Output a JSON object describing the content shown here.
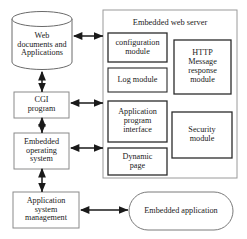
{
  "diagram": {
    "colors": {
      "stroke": "#2b2b2b",
      "panel_stroke": "#6e6e6e",
      "module_stroke": "#2b2b2b",
      "box_stroke": "#8a8a8a",
      "background": "#ffffff",
      "text": "#1a1a1a"
    },
    "left_column": {
      "datastore": {
        "label": "Web\ndocuments and\nApplications",
        "shape": "cylinder"
      },
      "boxes": [
        {
          "label": "CGI\nprogram",
          "shape": "rectangle"
        },
        {
          "label": "Embedded\noperating\nsystem",
          "shape": "rectangle"
        },
        {
          "label": "Application\nsystem\nmanagement",
          "shape": "rectangle"
        }
      ]
    },
    "server_panel": {
      "title": "Embedded web server",
      "left_modules": [
        {
          "label": "configuration\nmodule"
        },
        {
          "label": "Log module"
        },
        {
          "label": "Application\nprogram\ninterface"
        },
        {
          "label": "Dynamic\npage"
        }
      ],
      "right_modules": [
        {
          "label": "HTTP\nMessage\nresponse\nmodule"
        },
        {
          "label": "Security\nmodule"
        }
      ]
    },
    "external": {
      "embedded_application": {
        "label": "Embedded application",
        "shape": "stadium"
      }
    },
    "connectors": [
      {
        "name": "web-docs-to-server",
        "type": "double-arrow",
        "orientation": "horizontal"
      },
      {
        "name": "web-docs-to-cgi",
        "type": "double-arrow",
        "orientation": "vertical"
      },
      {
        "name": "cgi-to-server",
        "type": "double-arrow",
        "orientation": "horizontal"
      },
      {
        "name": "cgi-to-os",
        "type": "double-arrow",
        "orientation": "vertical"
      },
      {
        "name": "os-to-server",
        "type": "double-arrow",
        "orientation": "horizontal"
      },
      {
        "name": "os-to-app-management",
        "type": "double-arrow",
        "orientation": "vertical"
      },
      {
        "name": "app-management-to-embedded-application",
        "type": "double-arrow",
        "orientation": "horizontal"
      }
    ]
  }
}
